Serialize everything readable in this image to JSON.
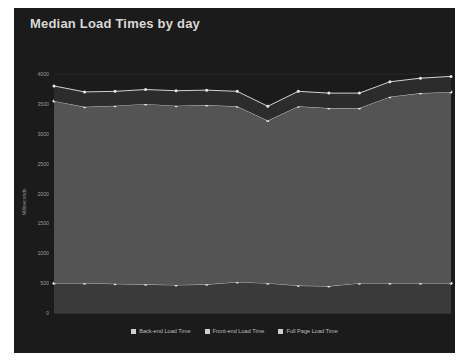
{
  "chart_data": {
    "type": "area",
    "title": "Median Load Times by day",
    "xlabel": "",
    "ylabel": "Milliseconds",
    "ylim": [
      0,
      4000
    ],
    "ytick_values": [
      0,
      500,
      1000,
      1500,
      2000,
      2500,
      3000,
      3500,
      4000
    ],
    "ytick_labels": [
      "0",
      "500",
      "1000",
      "1500",
      "2000",
      "2500",
      "3000",
      "3500",
      "4000"
    ],
    "grid": true,
    "legend_position": "bottom",
    "stacked": true,
    "x": [
      "Sunday 2014-04-27",
      "Monday 2014-04-28",
      "Tuesday 2014-04-29",
      "Wednesday 2014-04-30",
      "Thursday 2014-05-01",
      "Friday 2014-05-02",
      "Saturday 2014-05-03",
      "Sunday 2014-05-04",
      "Monday 2014-05-05",
      "Tuesday 2014-05-06",
      "Wednesday 2014-05-07",
      "Thursday 2014-05-08",
      "Friday 2014-05-09",
      "Saturday 2014-05-10"
    ],
    "xtick_labels": [
      "Sunday 2014-04-27",
      "Thursday 2014-05-01",
      "Monday 2014-05-05",
      "Friday 2014-05-09"
    ],
    "xtick_indices": [
      0,
      4,
      8,
      12
    ],
    "series": [
      {
        "name": "Back-end Load Time",
        "color": "#d7d7d7",
        "fill": "#3a3a3a",
        "values": [
          500,
          500,
          490,
          480,
          470,
          480,
          520,
          500,
          460,
          450,
          500,
          500,
          500,
          500
        ]
      },
      {
        "name": "Front-end Load Time",
        "color": "#d7d7d7",
        "fill": "#545454",
        "values": [
          3050,
          2950,
          2980,
          3020,
          3000,
          3000,
          2940,
          2720,
          3000,
          2980,
          2930,
          3120,
          3180,
          3200
        ]
      },
      {
        "name": "Full Page Load Time",
        "color": "#e4e4e4",
        "fill": "#2c2c2c",
        "values": [
          250,
          250,
          240,
          240,
          250,
          250,
          250,
          240,
          250,
          250,
          250,
          250,
          250,
          260
        ]
      }
    ],
    "cumulative": [
      {
        "name": "Back-end Load Time",
        "values": [
          500,
          500,
          490,
          480,
          470,
          480,
          520,
          500,
          460,
          450,
          500,
          500,
          500,
          500
        ]
      },
      {
        "name": "Front-end Load Time",
        "values": [
          3550,
          3450,
          3470,
          3500,
          3470,
          3480,
          3460,
          3220,
          3460,
          3430,
          3430,
          3620,
          3680,
          3700
        ]
      },
      {
        "name": "Full Page Load Time",
        "values": [
          3800,
          3700,
          3710,
          3740,
          3720,
          3730,
          3710,
          3460,
          3710,
          3680,
          3680,
          3870,
          3930,
          3960
        ]
      }
    ]
  },
  "colors": {
    "widget_background": "#1b1b1b",
    "plot_background": "#1b1b1b",
    "title_text": "#d8d8d8",
    "tick_text": "#9a9a9a",
    "grid_line": "#333333",
    "legend_text": "#bdbdbd",
    "legend_swatch": "#cfcfcf"
  },
  "legend": {
    "items": [
      {
        "label": "Back-end Load Time",
        "swatch": "#cfcfcf"
      },
      {
        "label": "Front-end Load Time",
        "swatch": "#cfcfcf"
      },
      {
        "label": "Full Page Load Time",
        "swatch": "#cfcfcf"
      }
    ]
  }
}
